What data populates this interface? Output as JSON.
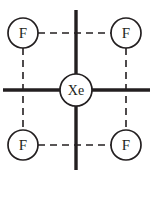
{
  "figure": {
    "name": "xenon-tetrafluoride-square-planar-structure",
    "width": 153,
    "height": 208,
    "background_color": "#ffffff"
  },
  "colors": {
    "stroke": "#231f20",
    "bond_solid": "#231f20",
    "bond_dashed": "#231f20",
    "circle_fill": "#ffffff",
    "text": "#231f20"
  },
  "atoms": {
    "center": {
      "label": "Xe",
      "cx": 76,
      "cy": 90,
      "r": 16
    },
    "ligands": [
      {
        "label": "F",
        "position": "top-left",
        "cx": 23,
        "cy": 33,
        "r": 15
      },
      {
        "label": "F",
        "position": "top-right",
        "cx": 126,
        "cy": 33,
        "r": 15
      },
      {
        "label": "F",
        "position": "bottom-left",
        "cx": 23,
        "cy": 145,
        "r": 15
      },
      {
        "label": "F",
        "position": "bottom-right",
        "cx": 126,
        "cy": 145,
        "r": 15
      }
    ]
  },
  "bonds": {
    "solid": [
      {
        "name": "bond-up",
        "x1": 76,
        "y1": 10,
        "x2": 76,
        "y2": 74
      },
      {
        "name": "bond-down",
        "x1": 76,
        "y1": 106,
        "x2": 76,
        "y2": 170
      },
      {
        "name": "bond-left",
        "x1": 3,
        "y1": 90,
        "x2": 60,
        "y2": 90
      },
      {
        "name": "bond-right",
        "x1": 92,
        "y1": 90,
        "x2": 150,
        "y2": 90
      }
    ],
    "dashed": [
      {
        "name": "dash-top",
        "x1": 38,
        "y1": 33,
        "x2": 111,
        "y2": 33
      },
      {
        "name": "dash-bottom",
        "x1": 38,
        "y1": 145,
        "x2": 111,
        "y2": 145
      },
      {
        "name": "dash-left",
        "x1": 23,
        "y1": 48,
        "x2": 23,
        "y2": 130
      },
      {
        "name": "dash-right",
        "x1": 126,
        "y1": 48,
        "x2": 126,
        "y2": 130
      }
    ]
  },
  "style": {
    "solid_bond_width": 3.4,
    "dashed_bond_width": 1.6,
    "dash_pattern": "7 5",
    "circle_stroke_width": 1.7
  }
}
